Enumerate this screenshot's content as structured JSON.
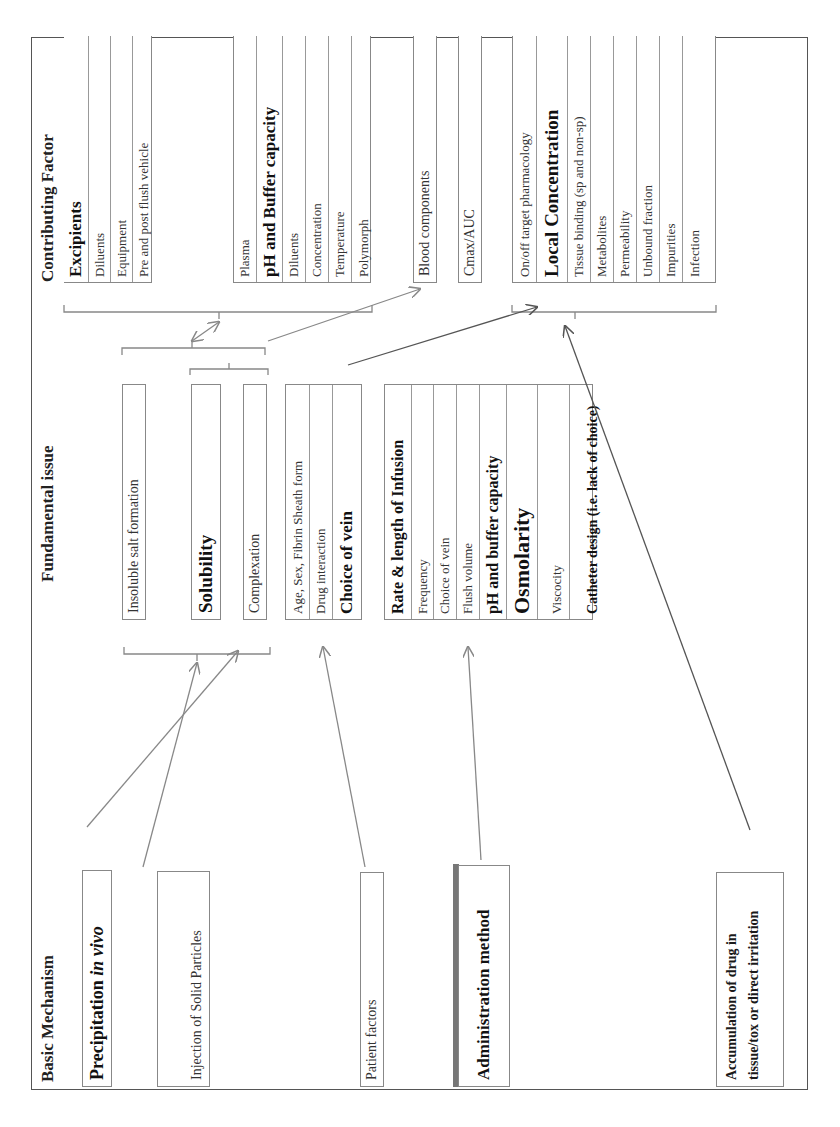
{
  "headers": {
    "basic": "Basic Mechanism",
    "fundamental": "Fundamental issue",
    "contributing": "Contributing Factor"
  },
  "basic_mechanisms": {
    "precipitation": "Precipitation",
    "precipitation_italic": "in vivo",
    "injection": "Injection of Solid Particles",
    "patient": "Patient factors",
    "administration": "Administration method",
    "accumulation": "Accumulation of drug in tissue/tox or direct irritation"
  },
  "fundamental_issues": {
    "insoluble": "Insoluble salt formation",
    "solubility": "Solubility",
    "complexation": "Complexation",
    "patient_group": [
      "Age, Sex, Fibrin Sheath form",
      "Drug interaction",
      "Choice of vein"
    ],
    "admin_group": [
      "Rate & length of Infusion",
      "Frequency",
      "Choice of vein",
      "Flush volume",
      "pH and buffer capacity",
      "Osmolarity",
      "Viscocity",
      "Catheter design (i.e. lack of choice)"
    ]
  },
  "contributing_factors": {
    "excipients_group": [
      "Excipients",
      "Diluents",
      "Equipment",
      "Pre and post flush vehicle"
    ],
    "ph_group": [
      "Plasma",
      "pH and Buffer capacity",
      "Diluents",
      "Concentration",
      "Temperature",
      "Polymorph"
    ],
    "blood": "Blood components",
    "cmax": "Cmax/AUC",
    "local_group": [
      "On/off target pharmacology",
      "Local Concentration",
      "Tissue binding (sp and non-sp)",
      "Metabolites",
      "Permeability",
      "Unbound fraction",
      "Impurities",
      "Infection"
    ]
  },
  "colors": {
    "line": "#888888",
    "frame": "#555555",
    "dark_line": "#444444"
  }
}
